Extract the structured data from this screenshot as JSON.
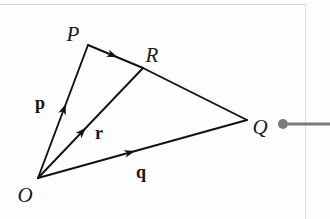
{
  "figure": {
    "background_color": "#fdfdfd",
    "stroke_color": "#121212",
    "rule_color": "#cfcfcf",
    "connector_color": "#7a7a7a",
    "points": [
      {
        "id": "O",
        "label": "O",
        "x": 38,
        "y": 178,
        "label_x": 25,
        "label_y": 195
      },
      {
        "id": "P",
        "label": "P",
        "x": 88,
        "y": 45,
        "label_x": 73,
        "label_y": 34
      },
      {
        "id": "R",
        "label": "R",
        "x": 143,
        "y": 68,
        "label_x": 152,
        "label_y": 55
      },
      {
        "id": "Q",
        "label": "Q",
        "x": 247,
        "y": 120,
        "label_x": 260,
        "label_y": 127
      }
    ],
    "vectors": [
      {
        "id": "p",
        "label": "p",
        "from": "O",
        "to": "P",
        "label_x": 40,
        "label_y": 103,
        "arrow_at": 0.55
      },
      {
        "id": "r",
        "label": "r",
        "from": "O",
        "to": "R",
        "label_x": 99,
        "label_y": 133,
        "arrow_at": 0.45
      },
      {
        "id": "q",
        "label": "q",
        "from": "O",
        "to": "Q",
        "label_x": 141,
        "label_y": 172,
        "arrow_at": 0.46
      },
      {
        "id": "pr",
        "label": "",
        "from": "P",
        "to": "R",
        "label_x": 0,
        "label_y": 0,
        "arrow_at": 0.52
      }
    ],
    "plain_edges": [
      {
        "id": "rq",
        "from": "R",
        "to": "Q"
      }
    ],
    "connector": {
      "dot_x": 283,
      "dot_y": 124,
      "dot_r": 5,
      "line_x1": 288,
      "line_y1": 124,
      "line_x2": 330,
      "line_y2": 124
    }
  }
}
